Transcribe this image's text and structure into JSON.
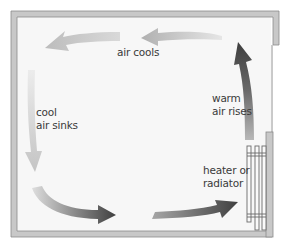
{
  "diagram": {
    "labels": {
      "air_cools": "air cools",
      "cool_air_sinks_line1": "cool",
      "cool_air_sinks_line2": "air sinks",
      "warm_air_rises_line1": "warm",
      "warm_air_rises_line2": "air rises",
      "heater_line1": "heater or",
      "heater_line2": "radiator"
    },
    "colors": {
      "wall_fill": "#c8c8c8",
      "wall_stroke": "#8a8a8a",
      "room_bg": "#f7f7f7",
      "text": "#3a3a3a",
      "arrow_light": "#d8d8d8",
      "arrow_mid": "#a8a8a8",
      "arrow_dark": "#4a4a4a"
    },
    "arrows": [
      {
        "id": "top-right",
        "direction": "left",
        "shade": "light-gray"
      },
      {
        "id": "top-left",
        "direction": "left",
        "shade": "light-gray"
      },
      {
        "id": "left",
        "direction": "down",
        "shade": "lightest"
      },
      {
        "id": "bottom-left",
        "direction": "right",
        "shade": "light-to-dark"
      },
      {
        "id": "bottom-right",
        "direction": "right",
        "shade": "gray-to-dark"
      },
      {
        "id": "right",
        "direction": "up",
        "shade": "dark-to-light"
      }
    ]
  }
}
